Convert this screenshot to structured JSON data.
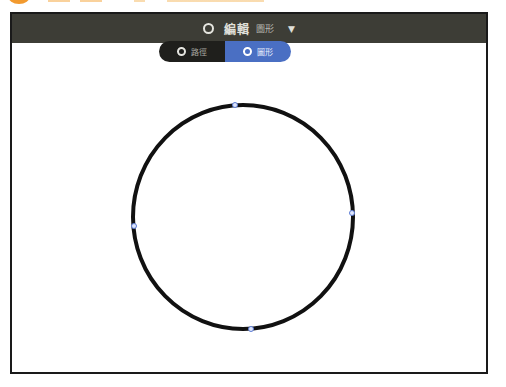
{
  "header": {
    "icon": "circle-outline-icon",
    "title": "編輯",
    "subtitle": "圖形",
    "caret_icon": "caret-down-icon",
    "caret_glyph": "▼",
    "background": "#3d3d36"
  },
  "mode_toggle": {
    "options": [
      {
        "label": "路徑",
        "icon": "path-ring-icon",
        "selected": false,
        "color": "#1f1f1c"
      },
      {
        "label": "圖形",
        "icon": "shape-ring-icon",
        "selected": true,
        "color": "#4a6fc3"
      }
    ]
  },
  "canvas": {
    "shape": "ellipse",
    "stroke_color": "#111111",
    "handle_color": "#5b7bd5",
    "center": [
      243,
      217
    ],
    "radii": [
      110,
      112
    ],
    "anchor_points": [
      "top",
      "right",
      "bottom",
      "left"
    ]
  }
}
